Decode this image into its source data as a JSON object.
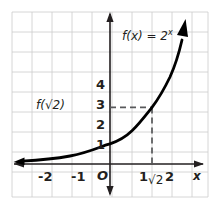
{
  "figure": {
    "name": "exponential-function-graph",
    "background_color": "#ffffff",
    "grid_color": "#c9c9c9",
    "axis_color": "#231f20",
    "curve_color": "#000000",
    "dash_color": "#58595b"
  },
  "chart_data": {
    "type": "line",
    "title": "",
    "subtitle": "",
    "xlabel": "x",
    "ylabel": "",
    "function_label": "f(x) = 2",
    "function_label_exponent": "x",
    "equation": "f(x) = 2^x",
    "grid": true,
    "grid_step": 0.5,
    "legend": "none",
    "xlim": [
      -3.1,
      3.2
    ],
    "ylim": [
      -1.3,
      4.9
    ],
    "x_ticks": [
      -2,
      -1,
      1,
      2
    ],
    "x_tick_labels": [
      "-2",
      "-1",
      "1",
      "2"
    ],
    "y_ticks": [
      1,
      2,
      3,
      4
    ],
    "y_tick_labels": [
      "1",
      "2",
      "3",
      "4"
    ],
    "origin_label": "O",
    "series": [
      {
        "name": "f(x) = 2^x",
        "x": [
          -3.0,
          -2.5,
          -2.0,
          -1.5,
          -1.0,
          -0.5,
          0.0,
          0.5,
          1.0,
          1.25,
          1.5,
          1.75,
          2.0,
          2.25,
          2.4
        ],
        "values": [
          0.125,
          0.177,
          0.25,
          0.354,
          0.5,
          0.707,
          1.0,
          1.414,
          2.0,
          2.378,
          2.828,
          3.364,
          4.0,
          4.757,
          5.278
        ],
        "arrow_start": true,
        "arrow_end": true
      }
    ],
    "annotations": [
      {
        "name": "f-of-sqrt2-value-label",
        "text": "f(√2)",
        "text_plain": "f(sqrt(2))",
        "x": -0.95,
        "y": 2.83,
        "align": "right"
      },
      {
        "name": "sqrt2-x-axis-label",
        "text": "√2",
        "text_plain": "sqrt(2)",
        "x": 1.414,
        "y": -0.55
      }
    ],
    "guide_lines": [
      {
        "name": "horizontal-dashed-guide",
        "from": [
          0,
          2.828
        ],
        "to": [
          1.414,
          2.828
        ],
        "style": "dashed"
      },
      {
        "name": "vertical-dashed-guide",
        "from": [
          1.414,
          2.828
        ],
        "to": [
          1.414,
          0
        ],
        "style": "dashed"
      }
    ],
    "highlight_point": {
      "x": 1.414,
      "y": 2.828,
      "label": "f(√2)"
    }
  },
  "labels": {
    "y4": "4",
    "y3": "3",
    "y2": "2",
    "y1": "1",
    "xm2": "-2",
    "xm1": "-1",
    "x1": "1",
    "x2": "2",
    "origin": "O",
    "x_axis_name": "x",
    "fn_base": "f(x) = 2",
    "fn_exponent": "x",
    "f_sqrt2": "f(√2)",
    "sqrt2": "√2"
  }
}
